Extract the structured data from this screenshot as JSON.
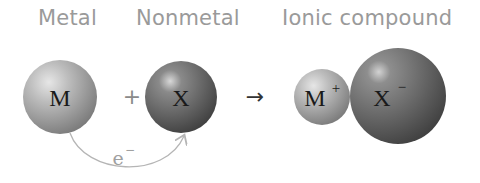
{
  "labels": {
    "metal": "Metal",
    "nonmetal": "Nonmetal",
    "ionic_compound": "Ionic compound"
  },
  "reactants": {
    "metal_symbol": "M",
    "plus": "+",
    "nonmetal_symbol": "X"
  },
  "arrow": "→",
  "electron": {
    "symbol": "e",
    "charge": "−"
  },
  "product": {
    "cation_symbol": "M",
    "cation_charge": "+",
    "anion_symbol": "X",
    "anion_charge": "−"
  },
  "colors": {
    "label": "#9a9a9a",
    "metal_sphere": "#a8a8a8",
    "nonmetal_sphere": "#6e6e6e",
    "electron_arrow": "#b5b5b5"
  }
}
